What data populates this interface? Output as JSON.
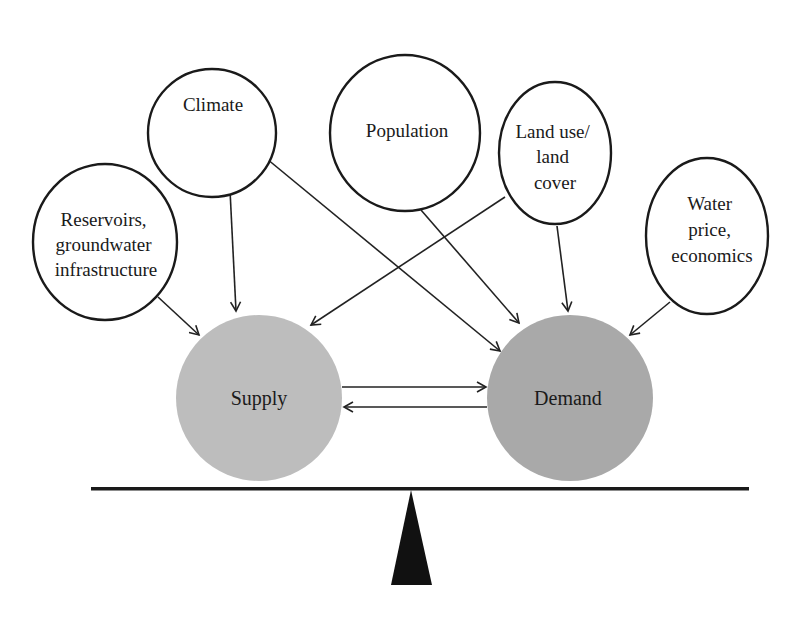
{
  "diagram": {
    "type": "influence-balance",
    "colors": {
      "outline": "#1a1a1a",
      "supply_fill": "#bdbdbd",
      "demand_fill": "#a9a9a9",
      "beam": "#1a1a1a",
      "fulcrum": "#111111"
    },
    "drivers": [
      {
        "id": "reservoirs",
        "lines": [
          "Reservoirs,",
          "groundwater",
          "infrastructure"
        ]
      },
      {
        "id": "climate",
        "lines": [
          "Climate"
        ]
      },
      {
        "id": "population",
        "lines": [
          "Population"
        ]
      },
      {
        "id": "landuse",
        "lines": [
          "Land use/",
          "land",
          "cover"
        ]
      },
      {
        "id": "waterprice",
        "lines": [
          "Water",
          "price,",
          "economics"
        ]
      }
    ],
    "outcomes": {
      "supply": {
        "label": "Supply"
      },
      "demand": {
        "label": "Demand"
      }
    },
    "edges": [
      {
        "from": "reservoirs",
        "to": "supply"
      },
      {
        "from": "climate",
        "to": "supply"
      },
      {
        "from": "climate",
        "to": "demand"
      },
      {
        "from": "population",
        "to": "demand"
      },
      {
        "from": "landuse",
        "to": "supply"
      },
      {
        "from": "landuse",
        "to": "demand"
      },
      {
        "from": "waterprice",
        "to": "demand"
      },
      {
        "from": "supply",
        "to": "demand"
      },
      {
        "from": "demand",
        "to": "supply"
      }
    ],
    "balance": {
      "beam": "horizontal",
      "fulcrum": "triangle"
    }
  }
}
